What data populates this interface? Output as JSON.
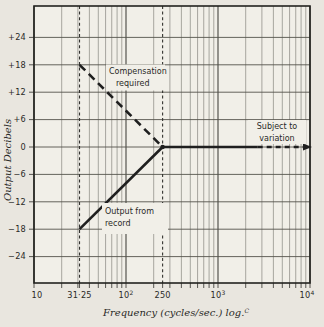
{
  "figure": {
    "x_axis_label": "Frequency (cycles/sec.) log.^C",
    "y_axis_label": "Output Decibels"
  },
  "chart_data": {
    "type": "line",
    "x_axis": {
      "scale": "log",
      "min": 10,
      "max": 10000,
      "label": "Frequency (cycles/sec.) log.^C",
      "ticks": [
        {
          "value": 10,
          "label": "10"
        },
        {
          "value": 31.25,
          "label": "31·25"
        },
        {
          "value": 100,
          "label": "10^2"
        },
        {
          "value": 250,
          "label": "250"
        },
        {
          "value": 1000,
          "label": "10^3"
        },
        {
          "value": 10000,
          "label": "10^4"
        }
      ],
      "minor_gridlines": "log decades 2-9",
      "grid": true
    },
    "y_axis": {
      "label": "Output Decibels",
      "min": -30,
      "max": 30,
      "ticks": [
        {
          "value": 24,
          "label": "+24"
        },
        {
          "value": 18,
          "label": "+18"
        },
        {
          "value": 12,
          "label": "+12"
        },
        {
          "value": 6,
          "label": "+6"
        },
        {
          "value": 0,
          "label": "0"
        },
        {
          "value": -6,
          "label": "−6"
        },
        {
          "value": -12,
          "label": "−12"
        },
        {
          "value": -18,
          "label": "−18"
        },
        {
          "value": -24,
          "label": "−24"
        }
      ],
      "grid": true
    },
    "reference_lines": [
      {
        "axis": "x",
        "value": 31.25,
        "style": "dashed"
      },
      {
        "axis": "x",
        "value": 250,
        "style": "dashed"
      }
    ],
    "series": [
      {
        "name": "Compensation required",
        "style": "dashed",
        "points": [
          [
            31.25,
            18
          ],
          [
            250,
            0
          ]
        ]
      },
      {
        "name": "Output from record",
        "style": "solid",
        "points": [
          [
            31.25,
            -18
          ],
          [
            250,
            0
          ]
        ]
      },
      {
        "name": "Level response (subject to variation)",
        "style": "solid",
        "dashed_from": 2700,
        "arrow_end": true,
        "points": [
          [
            250,
            0
          ],
          [
            10000,
            0
          ]
        ]
      }
    ],
    "annotations": [
      {
        "id": "compensation",
        "lines": [
          "Compensation",
          "required"
        ]
      },
      {
        "id": "record",
        "lines": [
          "Output from",
          "record"
        ]
      },
      {
        "id": "variation",
        "lines": [
          "Subject to",
          "variation"
        ]
      }
    ],
    "colors": {
      "ink": "#1f1f1f",
      "major_grid": "#45443f",
      "horizontal_grid": "#55534c",
      "minor_grid": "#8e8c85",
      "paper": "#e9e6df",
      "plot_background": "#f1efe8"
    }
  }
}
